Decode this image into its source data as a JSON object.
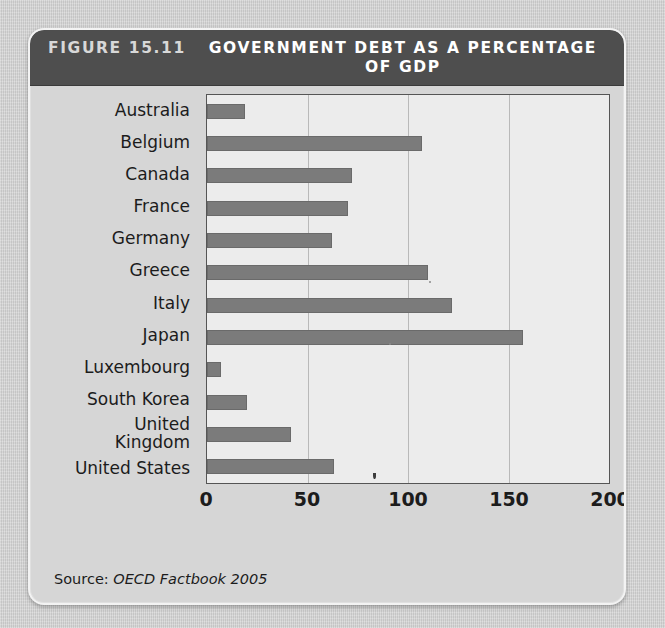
{
  "figure": {
    "number_label": "FIGURE 15.11",
    "title": "GOVERNMENT DEBT AS A\nPERCENTAGE OF GDP",
    "source_prefix": "Source:",
    "source_citation": "OECD Factbook 2005"
  },
  "colors": {
    "title_bar": "#4e4e4e",
    "panel_background": "#d6d6d6",
    "plot_background": "#ececec",
    "bar": "#7b7b7b",
    "gridline": "#b9b9b9",
    "axis_text": "#1c1c1c"
  },
  "chart_data": {
    "type": "bar",
    "orientation": "horizontal",
    "title": "GOVERNMENT DEBT AS A PERCENTAGE OF GDP",
    "subtitle": "",
    "xlabel": "",
    "ylabel": "",
    "xlim": [
      0,
      200
    ],
    "xticks": [
      0,
      50,
      100,
      150,
      200
    ],
    "xticklabels": [
      "0",
      "50",
      "100",
      "150",
      "200"
    ],
    "grid": "vertical",
    "legend": "none",
    "source": "OECD Factbook 2005",
    "categories": [
      "Australia",
      "Belgium",
      "Canada",
      "France",
      "Germany",
      "Greece",
      "Italy",
      "Japan",
      "Luxembourg",
      "South Korea",
      "United\nKingdom",
      "United States"
    ],
    "values": [
      19,
      107,
      72,
      70,
      62,
      110,
      122,
      157,
      7,
      20,
      42,
      63
    ]
  }
}
